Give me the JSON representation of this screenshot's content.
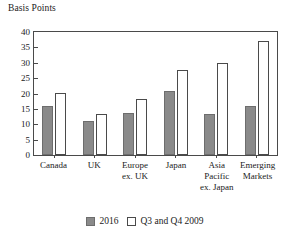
{
  "chart_data": {
    "type": "bar",
    "title": "",
    "ylabel": "Basis Points",
    "xlabel": "",
    "ylim": [
      0,
      40
    ],
    "yticks": [
      0,
      5,
      10,
      15,
      20,
      25,
      30,
      35,
      40
    ],
    "grid": false,
    "legend_position": "bottom",
    "categories": [
      "Canada",
      "UK",
      "Europe\nex. UK",
      "Japan",
      "Asia\nPacific\nex. Japan",
      "Emerging\nMarkets"
    ],
    "series": [
      {
        "name": "2016",
        "color": "#8a8a8a",
        "values": [
          16.1,
          11.2,
          13.6,
          20.7,
          13.2,
          16.0
        ]
      },
      {
        "name": "Q3 and Q4 2009",
        "color": "#ffffff",
        "values": [
          20.2,
          13.4,
          18.3,
          27.6,
          29.9,
          37.2
        ]
      }
    ]
  },
  "legend": {
    "items": [
      {
        "label": "2016"
      },
      {
        "label": "Q3 and Q4 2009"
      }
    ]
  }
}
